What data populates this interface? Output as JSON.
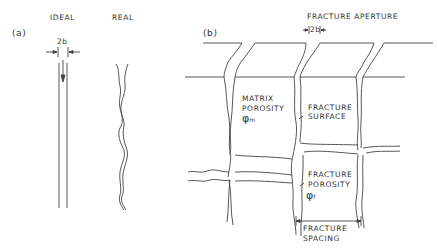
{
  "panel_a": {
    "label": "(a)",
    "ideal_title": "IDEAL",
    "real_title": "REAL",
    "aperture_label": "2b"
  },
  "panel_b": {
    "label": "(b)",
    "aperture_title": "FRACTURE APERTURE",
    "aperture_label": "2b",
    "matrix_porosity": [
      "MATRIX",
      "POROSITY"
    ],
    "matrix_symbol": "φ",
    "matrix_sub": "m",
    "fracture_surface": [
      "FRACTURE",
      "SURFACE"
    ],
    "fracture_porosity": [
      "FRACTURE",
      "POROSITY"
    ],
    "fracture_symbol": "φ",
    "fracture_sub": "f",
    "fracture_spacing": [
      "FRACTURE",
      "SPACING"
    ]
  }
}
